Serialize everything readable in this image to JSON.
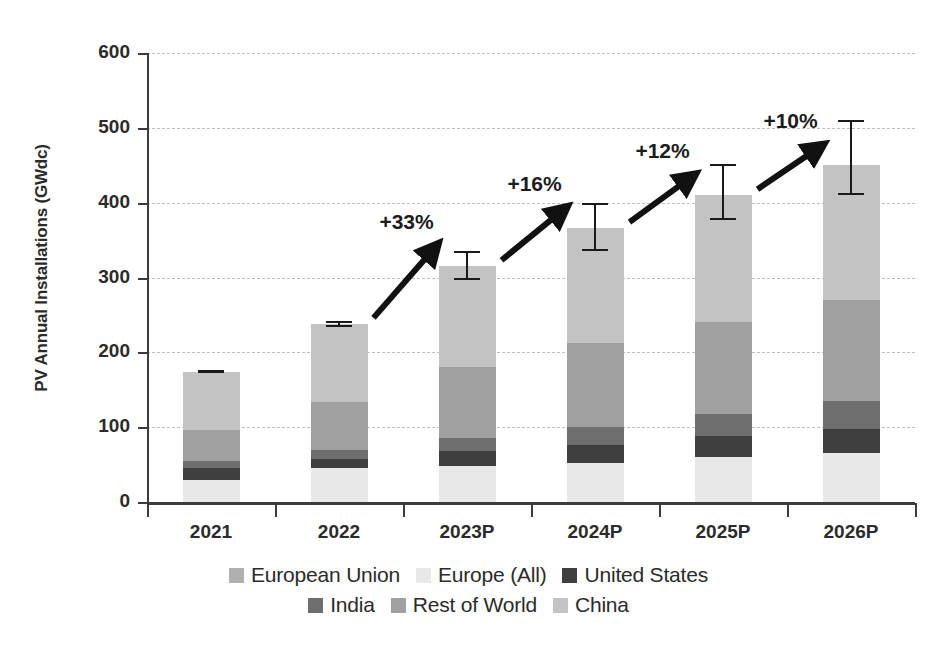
{
  "chart_data": {
    "type": "bar",
    "stacked": true,
    "title": "",
    "xlabel": "",
    "ylabel": "PV Annual Installations (GWdc)",
    "ylim": [
      0,
      600
    ],
    "yticks": [
      0,
      100,
      200,
      300,
      400,
      500,
      600
    ],
    "ytick_labels": [
      "0",
      "100",
      "200",
      "300",
      "400",
      "500",
      "600"
    ],
    "grid": true,
    "legend_position": "bottom",
    "categories": [
      "2021",
      "2022",
      "2023P",
      "2024P",
      "2025P",
      "2026P"
    ],
    "series": [
      {
        "name": "Europe (All)",
        "color": "#e8e8e8",
        "values": [
          29,
          46,
          48,
          52,
          60,
          65
        ]
      },
      {
        "name": "United States",
        "color": "#3f3f3f",
        "values": [
          17,
          12,
          0,
          0,
          0,
          0
        ]
      },
      {
        "name": "India",
        "color": "#6e6e6e",
        "values": [
          9,
          11,
          37,
          48,
          58,
          70
        ]
      },
      {
        "name": "Rest of World",
        "color": "#a0a0a0",
        "values": [
          41,
          65,
          95,
          112,
          122,
          135
        ]
      },
      {
        "name": "China",
        "color": "#c3c3c3",
        "values": [
          54,
          104,
          135,
          154,
          170,
          180
        ]
      },
      {
        "name": "European Union",
        "color": "#b0b0b0",
        "values": [
          24,
          0,
          0,
          0,
          0,
          0
        ]
      }
    ],
    "totals": [
      174,
      238,
      315,
      366,
      410,
      450
    ],
    "stack_boundaries_gwdc": {
      "2021": {
        "europe_all": [
          0,
          29
        ],
        "united_states": [
          29,
          46
        ],
        "india": [
          46,
          55
        ],
        "rest_of_world": [
          55,
          96
        ],
        "china": [
          96,
          174
        ]
      },
      "2022": {
        "europe_all": [
          0,
          46
        ],
        "united_states": [
          46,
          58
        ],
        "india": [
          58,
          69
        ],
        "rest_of_world": [
          69,
          134
        ],
        "china": [
          134,
          238
        ]
      },
      "2023P": {
        "europe_all": [
          0,
          48
        ],
        "united_states": [
          48,
          68
        ],
        "india": [
          68,
          85
        ],
        "rest_of_world": [
          85,
          180
        ],
        "china": [
          180,
          315
        ]
      },
      "2024P": {
        "europe_all": [
          0,
          52
        ],
        "united_states": [
          52,
          76
        ],
        "india": [
          76,
          100
        ],
        "rest_of_world": [
          100,
          212
        ],
        "china": [
          212,
          366
        ]
      },
      "2025P": {
        "europe_all": [
          0,
          60
        ],
        "united_states": [
          60,
          88
        ],
        "india": [
          88,
          118
        ],
        "rest_of_world": [
          118,
          240
        ],
        "china": [
          240,
          410
        ]
      },
      "2026P": {
        "europe_all": [
          0,
          65
        ],
        "united_states": [
          65,
          98
        ],
        "india": [
          98,
          135
        ],
        "rest_of_world": [
          135,
          270
        ],
        "china": [
          270,
          450
        ]
      }
    },
    "error_bars": [
      {
        "category": "2021",
        "low": 172,
        "high": 176
      },
      {
        "category": "2022",
        "low": 234,
        "high": 242
      },
      {
        "category": "2023P",
        "low": 296,
        "high": 335
      },
      {
        "category": "2024P",
        "low": 335,
        "high": 400
      },
      {
        "category": "2025P",
        "low": 377,
        "high": 452
      },
      {
        "category": "2026P",
        "low": 410,
        "high": 510
      }
    ],
    "annotations": [
      {
        "label": "+33%",
        "from": "2022",
        "to": "2023P"
      },
      {
        "label": "+16%",
        "from": "2023P",
        "to": "2024P"
      },
      {
        "label": "+12%",
        "from": "2024P",
        "to": "2025P"
      },
      {
        "label": "+10%",
        "from": "2025P",
        "to": "2026P"
      }
    ],
    "legend": [
      {
        "label": "European Union",
        "color": "#b0b0b0"
      },
      {
        "label": "Europe (All)",
        "color": "#e8e8e8"
      },
      {
        "label": "United States",
        "color": "#3f3f3f"
      },
      {
        "label": "India",
        "color": "#6e6e6e"
      },
      {
        "label": "Rest of World",
        "color": "#a0a0a0"
      },
      {
        "label": "China",
        "color": "#c3c3c3"
      }
    ]
  }
}
